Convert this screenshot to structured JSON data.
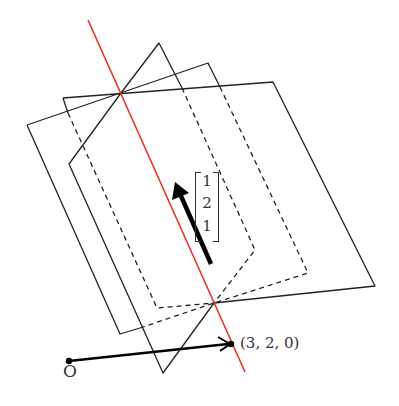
{
  "figure": {
    "point_label": "(3, 2, 0)",
    "origin_label": "O",
    "direction_vector": [
      "1",
      "2",
      "1"
    ],
    "colors": {
      "line": "#e8332a",
      "planes": "#222222",
      "arrow": "#000000"
    }
  }
}
